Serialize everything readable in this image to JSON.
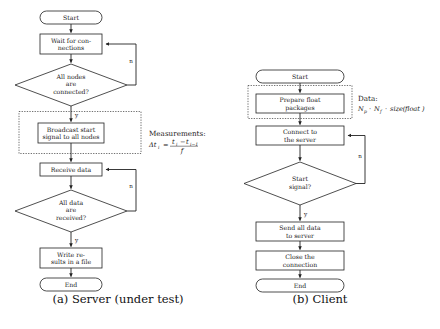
{
  "figure": {
    "panels": [
      {
        "id": "server",
        "caption": "(a) Server (under test)",
        "nodes": [
          {
            "key": "start",
            "type": "terminal",
            "label": "Start"
          },
          {
            "key": "wait",
            "type": "process",
            "label_line1": "Wait for con-",
            "label_line2": "nections"
          },
          {
            "key": "allnodes",
            "type": "decision",
            "label_line1": "All nodes",
            "label_line2": "are",
            "label_line3": "connected?"
          },
          {
            "key": "broadcast",
            "type": "process",
            "label_line1": "Broadcast start",
            "label_line2": "signal to all nodes"
          },
          {
            "key": "receive",
            "type": "process",
            "label_line1": "Receive data"
          },
          {
            "key": "alldata",
            "type": "decision",
            "label_line1": "All data",
            "label_line2": "are",
            "label_line3": "received?"
          },
          {
            "key": "write",
            "type": "process",
            "label_line1": "Write re-",
            "label_line2": "sults in a file"
          },
          {
            "key": "end",
            "type": "terminal",
            "label": "End"
          }
        ],
        "branch_labels": {
          "allnodes_no": "n",
          "allnodes_yes": "y",
          "alldata_no": "n",
          "alldata_yes": "y"
        },
        "annotation": {
          "title": "Measurements:",
          "formula_lhs": "Δt",
          "formula_lhs_sub": "i",
          "formula_eq": "=",
          "formula_num_a": "t",
          "formula_num_a_sub": "i",
          "formula_num_minus": "−",
          "formula_num_b": "t",
          "formula_num_b_sub": "i−1",
          "formula_den": "f"
        }
      },
      {
        "id": "client",
        "caption": "(b) Client",
        "nodes": [
          {
            "key": "start",
            "type": "terminal",
            "label": "Start"
          },
          {
            "key": "prepare",
            "type": "process",
            "label_line1": "Prepare float",
            "label_line2": "packages"
          },
          {
            "key": "connect",
            "type": "process",
            "label_line1": "Connect to",
            "label_line2": "the server"
          },
          {
            "key": "startsignal",
            "type": "decision",
            "label_line1": "Start",
            "label_line2": "signal?"
          },
          {
            "key": "send",
            "type": "process",
            "label_line1": "Send all data",
            "label_line2": "to server"
          },
          {
            "key": "close",
            "type": "process",
            "label_line1": "Close the",
            "label_line2": "connection"
          },
          {
            "key": "end",
            "type": "terminal",
            "label": "End"
          }
        ],
        "branch_labels": {
          "startsignal_no": "n",
          "startsignal_yes": "y"
        },
        "annotation": {
          "title": "Data:",
          "formula_np": "N",
          "formula_np_sub": "p",
          "formula_dot1": "·",
          "formula_nf": "N",
          "formula_nf_sub": "f",
          "formula_dot2": "·",
          "formula_size": "size(",
          "formula_float": "float",
          "formula_close": ")"
        }
      }
    ]
  },
  "colors": {
    "background": "#ffffff",
    "stroke": "#222222",
    "text": "#1a1a1a",
    "dotted": "#333333"
  }
}
